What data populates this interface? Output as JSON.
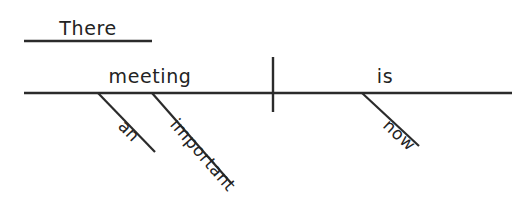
{
  "diagram": {
    "type": "reed-kellogg-sentence-diagram",
    "sentence": "There is an important meeting now",
    "ink_color": "#2b2b2b",
    "text_color": "#232323",
    "background_color": "#ffffff",
    "canvas": {
      "width": 532,
      "height": 197
    },
    "words": {
      "expletive": "There",
      "subject": "meeting",
      "verb": "is",
      "article_modifier": "an",
      "adjective_modifier": "important",
      "adverb_modifier": "now"
    },
    "labels": [
      {
        "id": "expletive-there",
        "text": "There",
        "x": 88,
        "y": 28,
        "rotation": 0
      },
      {
        "id": "subject-meeting",
        "text": "meeting",
        "x": 150,
        "y": 76,
        "rotation": 0
      },
      {
        "id": "verb-is",
        "text": "is",
        "x": 385,
        "y": 76,
        "rotation": 0
      },
      {
        "id": "modifier-an",
        "text": "an",
        "x": 115,
        "y": 112,
        "rotation": 46
      },
      {
        "id": "modifier-important",
        "text": "important",
        "x": 167,
        "y": 110,
        "rotation": 49
      },
      {
        "id": "modifier-now",
        "text": "now",
        "x": 380,
        "y": 112,
        "rotation": 43
      }
    ],
    "lines": [
      {
        "id": "expletive-rule",
        "x1": 24,
        "y1": 41,
        "x2": 152,
        "y2": 41
      },
      {
        "id": "baseline-main",
        "x1": 24,
        "y1": 93,
        "x2": 512,
        "y2": 93
      },
      {
        "id": "subject-verb-divider",
        "x1": 273,
        "y1": 57,
        "x2": 273,
        "y2": 112
      },
      {
        "id": "slant-an",
        "x1": 98,
        "y1": 93,
        "x2": 155,
        "y2": 152
      },
      {
        "id": "slant-important",
        "x1": 152,
        "y1": 93,
        "x2": 231,
        "y2": 183
      },
      {
        "id": "slant-now",
        "x1": 362,
        "y1": 93,
        "x2": 419,
        "y2": 146
      }
    ]
  }
}
